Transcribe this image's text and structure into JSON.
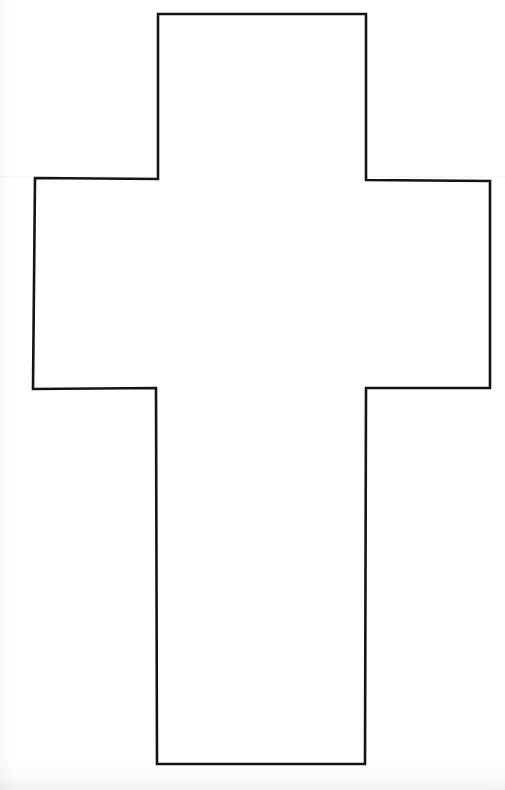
{
  "artwork": {
    "title": "Cross Outline",
    "shape_name": "latin-cross",
    "background_color": "#fefefe",
    "stroke_color": "#141414",
    "stroke_width": 2.6,
    "fill_color": "#ffffff",
    "canvas": {
      "width": 505,
      "height": 790
    },
    "outline_points": [
      [
        158,
        14
      ],
      [
        366,
        14
      ],
      [
        366,
        180
      ],
      [
        490,
        181
      ],
      [
        490,
        388
      ],
      [
        366,
        388
      ],
      [
        365,
        764
      ],
      [
        157,
        764
      ],
      [
        156,
        388
      ],
      [
        33,
        389
      ],
      [
        35,
        178
      ],
      [
        158,
        179
      ]
    ],
    "polygon_points_attr": "158,14 366,14 366,180 490,181 490,388 366,388 365,764 157,764 156,388 33,389 35,178 158,179",
    "segments": [
      {
        "name": "top-arm-top-edge",
        "from": [
          158,
          14
        ],
        "to": [
          366,
          14
        ]
      },
      {
        "name": "top-arm-right-edge",
        "from": [
          366,
          14
        ],
        "to": [
          366,
          180
        ]
      },
      {
        "name": "right-arm-top-edge",
        "from": [
          366,
          180
        ],
        "to": [
          490,
          181
        ]
      },
      {
        "name": "right-arm-right-edge",
        "from": [
          490,
          181
        ],
        "to": [
          490,
          388
        ]
      },
      {
        "name": "right-arm-bottom-edge",
        "from": [
          490,
          388
        ],
        "to": [
          366,
          388
        ]
      },
      {
        "name": "lower-shaft-right-edge",
        "from": [
          366,
          388
        ],
        "to": [
          365,
          764
        ]
      },
      {
        "name": "lower-shaft-bottom-edge",
        "from": [
          365,
          764
        ],
        "to": [
          157,
          764
        ]
      },
      {
        "name": "lower-shaft-left-edge",
        "from": [
          157,
          764
        ],
        "to": [
          156,
          388
        ]
      },
      {
        "name": "left-arm-bottom-edge",
        "from": [
          156,
          388
        ],
        "to": [
          33,
          389
        ]
      },
      {
        "name": "left-arm-left-edge",
        "from": [
          33,
          389
        ],
        "to": [
          35,
          178
        ]
      },
      {
        "name": "left-arm-top-edge",
        "from": [
          35,
          178
        ],
        "to": [
          158,
          179
        ]
      },
      {
        "name": "top-arm-left-edge",
        "from": [
          158,
          179
        ],
        "to": [
          158,
          14
        ]
      }
    ],
    "measurements": {
      "vertical_bar_left_x": 157,
      "vertical_bar_right_x": 366,
      "vertical_bar_width": 209,
      "top_arm_top_y": 14,
      "bottom_y": 764,
      "horizontal_arm_left_x": 34,
      "horizontal_arm_right_x": 490,
      "horizontal_arm_top_y": 179,
      "horizontal_arm_bottom_y": 388,
      "horizontal_arm_height": 209
    }
  }
}
